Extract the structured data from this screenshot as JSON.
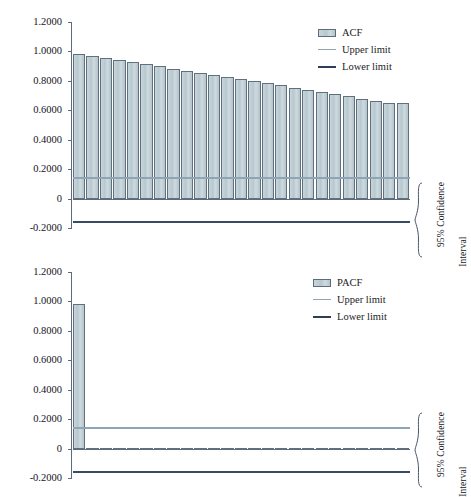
{
  "figure": {
    "background": "#ffffff",
    "colors": {
      "bar_fill": "#bccdd3",
      "bar_border": "#61707f",
      "upper_limit": "#8fa4b4",
      "lower_limit": "#3b4a63",
      "axis": "#5d6b7d",
      "text": "#14141e"
    }
  },
  "charts": [
    {
      "id": "acf",
      "legend": {
        "series_label": "ACF",
        "upper_label": "Upper limit",
        "lower_label": "Lower limit"
      },
      "annotation": {
        "line1": "95% Confidence",
        "line2": "Interval"
      },
      "yticks": [
        "1.2000",
        "1.0000",
        "0.8000",
        "0.6000",
        "0.4000",
        "0.2000",
        "0",
        "-0.2000"
      ]
    },
    {
      "id": "pacf",
      "legend": {
        "series_label": "PACF",
        "upper_label": "Upper limit",
        "lower_label": "Lower limit"
      },
      "annotation": {
        "line1": "95% Confidence",
        "line2": "Interval"
      },
      "yticks": [
        "1.2000",
        "1.0000",
        "0.8000",
        "0.6000",
        "0.4000",
        "0.2000",
        "0",
        "-0.2000"
      ]
    }
  ],
  "chart_data": [
    {
      "type": "bar",
      "id": "acf",
      "title": "",
      "xlabel": "",
      "ylabel": "",
      "ylim": [
        -0.2,
        1.2
      ],
      "ytick_values": [
        1.2,
        1.0,
        0.8,
        0.6,
        0.4,
        0.2,
        0,
        -0.2
      ],
      "ytick_labels": [
        "1.2000",
        "1.0000",
        "0.8000",
        "0.6000",
        "0.4000",
        "0.2000",
        "0",
        "-0.2000"
      ],
      "grid": false,
      "legend_position": "top-right",
      "legend_entries": [
        "ACF",
        "Upper limit",
        "Lower limit"
      ],
      "categories": [
        1,
        2,
        3,
        4,
        5,
        6,
        7,
        8,
        9,
        10,
        11,
        12,
        13,
        14,
        15,
        16,
        17,
        18,
        19,
        20,
        21,
        22,
        23,
        24,
        25
      ],
      "series": [
        {
          "name": "ACF",
          "values": [
            0.985,
            0.971,
            0.957,
            0.943,
            0.929,
            0.913,
            0.898,
            0.884,
            0.869,
            0.855,
            0.841,
            0.827,
            0.811,
            0.797,
            0.783,
            0.769,
            0.754,
            0.739,
            0.725,
            0.711,
            0.694,
            0.677,
            0.663,
            0.65,
            0.65
          ]
        }
      ],
      "reference_lines": [
        {
          "name": "Upper limit",
          "value": 0.145,
          "color": "#8fa4b4"
        },
        {
          "name": "Lower limit",
          "value": -0.155,
          "color": "#3b4a63"
        }
      ],
      "annotations": [
        {
          "text": "95% Confidence Interval",
          "position": "right",
          "rotation": 90
        }
      ]
    },
    {
      "type": "bar",
      "id": "pacf",
      "title": "",
      "xlabel": "",
      "ylabel": "",
      "ylim": [
        -0.2,
        1.2
      ],
      "ytick_values": [
        1.2,
        1.0,
        0.8,
        0.6,
        0.4,
        0.2,
        0,
        -0.2
      ],
      "ytick_labels": [
        "1.2000",
        "1.0000",
        "0.8000",
        "0.6000",
        "0.4000",
        "0.2000",
        "0",
        "-0.2000"
      ],
      "grid": false,
      "legend_position": "top-right",
      "legend_entries": [
        "PACF",
        "Upper limit",
        "Lower limit"
      ],
      "categories": [
        1,
        2,
        3,
        4,
        5,
        6,
        7,
        8,
        9,
        10,
        11,
        12,
        13,
        14,
        15,
        16,
        17,
        18,
        19,
        20,
        21,
        22,
        23,
        24,
        25
      ],
      "series": [
        {
          "name": "PACF",
          "values": [
            0.985,
            -0.012,
            -0.01,
            -0.011,
            -0.009,
            -0.013,
            -0.011,
            -0.012,
            -0.01,
            -0.013,
            -0.011,
            -0.009,
            -0.012,
            -0.01,
            -0.011,
            -0.013,
            -0.01,
            -0.012,
            -0.011,
            -0.009,
            -0.012,
            -0.01,
            -0.013,
            -0.011,
            -0.01
          ]
        }
      ],
      "reference_lines": [
        {
          "name": "Upper limit",
          "value": 0.145,
          "color": "#8fa4b4"
        },
        {
          "name": "Lower limit",
          "value": -0.155,
          "color": "#3b4a63"
        }
      ],
      "annotations": [
        {
          "text": "95% Confidence Interval",
          "position": "right",
          "rotation": 90
        }
      ]
    }
  ]
}
